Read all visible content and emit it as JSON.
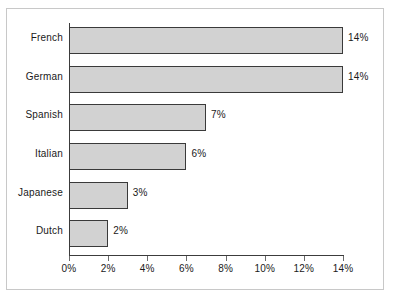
{
  "chart_data": {
    "type": "bar",
    "orientation": "horizontal",
    "title": "",
    "subtitle": "",
    "xlabel": "",
    "ylabel": "",
    "categories": [
      "French",
      "German",
      "Spanish",
      "Italian",
      "Japanese",
      "Dutch"
    ],
    "values": [
      14,
      14,
      7,
      6,
      3,
      2
    ],
    "value_labels": [
      "14%",
      "14%",
      "7%",
      "6%",
      "3%",
      "2%"
    ],
    "xlim": [
      0,
      14
    ],
    "xticks": [
      0,
      2,
      4,
      6,
      8,
      10,
      12,
      14
    ],
    "xtick_labels": [
      "0%",
      "2%",
      "4%",
      "6%",
      "8%",
      "10%",
      "12%",
      "14%"
    ],
    "grid": false,
    "legend": null,
    "legend_position": "none",
    "colors": {
      "bar_fill": "#d2d2d2",
      "bar_border": "#3a3a3a",
      "axis": "#3c3c3c",
      "frame": "#c8c8c8",
      "background": "#ffffff",
      "text": "#1a1a1a"
    }
  }
}
